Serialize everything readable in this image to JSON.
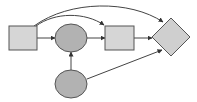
{
  "diagram": {
    "width": 197,
    "height": 102,
    "background": "#ffffff",
    "colors": {
      "rect_fill": "#d6d6d6",
      "ellipse_fill": "#b2b2b2",
      "diamond_fill": "#cfcfcf",
      "stroke": "#555555",
      "edge": "#444444"
    },
    "nodes": [
      {
        "id": "rect-left",
        "shape": "rectangle",
        "x": 9,
        "y": 26,
        "w": 28,
        "h": 24
      },
      {
        "id": "ellipse-top",
        "shape": "ellipse",
        "cx": 71,
        "cy": 38,
        "rx": 16,
        "ry": 14
      },
      {
        "id": "rect-middle",
        "shape": "rectangle",
        "x": 105,
        "y": 26,
        "w": 29,
        "h": 24
      },
      {
        "id": "diamond-right",
        "shape": "diamond",
        "cx": 171,
        "cy": 37,
        "r": 19
      },
      {
        "id": "ellipse-bottom",
        "shape": "ellipse",
        "cx": 71,
        "cy": 84,
        "rx": 16,
        "ry": 14
      }
    ],
    "edges": [
      {
        "from": "rect-left",
        "to": "ellipse-top",
        "type": "straight"
      },
      {
        "from": "ellipse-top",
        "to": "rect-middle",
        "type": "straight"
      },
      {
        "from": "rect-middle",
        "to": "diamond-right",
        "type": "straight"
      },
      {
        "from": "ellipse-bottom",
        "to": "ellipse-top",
        "type": "straight"
      },
      {
        "from": "ellipse-bottom",
        "to": "diamond-right",
        "type": "straight"
      },
      {
        "from": "rect-left",
        "to": "rect-middle",
        "type": "curved"
      },
      {
        "from": "rect-left",
        "to": "diamond-right",
        "type": "curved"
      }
    ]
  }
}
